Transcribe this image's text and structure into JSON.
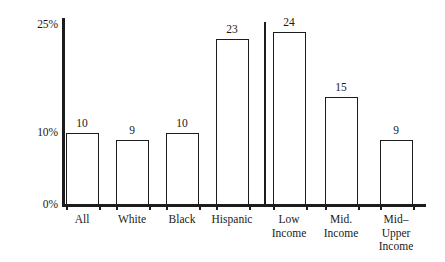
{
  "chart_data": {
    "type": "bar",
    "title": "",
    "subtitle": "",
    "xlabel": "",
    "ylabel": "",
    "categories": [
      "All",
      "White",
      "Black",
      "Hispanic",
      "Low\nIncome",
      "Mid.\nIncome",
      "Mid–\nUpper\nIncome"
    ],
    "values": [
      10,
      9,
      10,
      23,
      24,
      15,
      9
    ],
    "value_labels": [
      "10",
      "9",
      "10",
      "23",
      "24",
      "15",
      "9"
    ],
    "ylim": [
      0,
      25
    ],
    "yticks": [
      0,
      10,
      25
    ],
    "ytick_labels": [
      "0%",
      "10%",
      "25%"
    ],
    "grid": false,
    "legend": null,
    "groups": [
      {
        "name": "race-ethnicity",
        "categories": [
          "All",
          "White",
          "Black",
          "Hispanic"
        ]
      },
      {
        "name": "income",
        "categories": [
          "Low Income",
          "Mid. Income",
          "Mid–Upper Income"
        ]
      }
    ],
    "has_group_divider": true,
    "colors": {
      "bar_fill": "#ffffff",
      "bar_outline": "#1c1c1c",
      "bar_shadow": "#a8a8a8",
      "axis": "#1c1c1c",
      "text": "#1a1a1a",
      "background": "#ffffff"
    }
  },
  "axis": {
    "y_ticks": [
      {
        "label": "25%",
        "value": 25
      },
      {
        "label": "10%",
        "value": 10
      },
      {
        "label": "0%",
        "value": 0
      }
    ]
  },
  "bars": [
    {
      "label": "All",
      "value": 10,
      "value_label": "10"
    },
    {
      "label": "White",
      "value": 9,
      "value_label": "9"
    },
    {
      "label": "Black",
      "value": 10,
      "value_label": "10"
    },
    {
      "label": "Hispanic",
      "value": 23,
      "value_label": "23"
    },
    {
      "label": "Low\nIncome",
      "value": 24,
      "value_label": "24"
    },
    {
      "label": "Mid.\nIncome",
      "value": 15,
      "value_label": "15"
    },
    {
      "label": "Mid–\nUpper\nIncome",
      "value": 9,
      "value_label": "9"
    }
  ]
}
